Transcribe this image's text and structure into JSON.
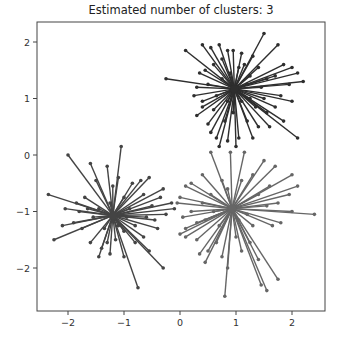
{
  "chart_data": {
    "type": "scatter",
    "title": "Estimated number of clusters:  3",
    "xlabel": "",
    "ylabel": "",
    "xlim": [
      -2.55,
      2.6
    ],
    "ylim": [
      -2.75,
      2.35
    ],
    "x_ticks": [
      -2,
      -1,
      0,
      1,
      2
    ],
    "y_ticks": [
      2,
      1,
      0,
      -1,
      -2
    ],
    "x_tick_labels": [
      "−2",
      "−1",
      "0",
      "1",
      "2"
    ],
    "y_tick_labels": [
      "2",
      "1",
      "0",
      "−1",
      "−2"
    ],
    "grid": false,
    "legend": null,
    "series": [
      {
        "name": "cluster-0",
        "color": "#2e2e2e",
        "center": [
          0.97,
          1.17
        ],
        "points": [
          [
            1.5,
            2.15
          ],
          [
            1.75,
            1.95
          ],
          [
            0.1,
            1.85
          ],
          [
            0.4,
            1.95
          ],
          [
            0.55,
            1.9
          ],
          [
            0.7,
            1.95
          ],
          [
            0.85,
            1.85
          ],
          [
            0.95,
            1.85
          ],
          [
            1.85,
            1.6
          ],
          [
            2.1,
            1.45
          ],
          [
            2.0,
            1.55
          ],
          [
            2.2,
            1.3
          ],
          [
            1.95,
            1.25
          ],
          [
            1.8,
            1.05
          ],
          [
            2.0,
            0.95
          ],
          [
            -0.25,
            1.35
          ],
          [
            0.3,
            1.2
          ],
          [
            0.25,
            1.05
          ],
          [
            0.4,
            0.95
          ],
          [
            0.3,
            0.7
          ],
          [
            0.5,
            0.55
          ],
          [
            0.55,
            0.4
          ],
          [
            0.65,
            0.3
          ],
          [
            0.7,
            0.15
          ],
          [
            0.85,
            0.25
          ],
          [
            1.0,
            0.15
          ],
          [
            1.05,
            0.3
          ],
          [
            1.3,
            0.3
          ],
          [
            1.4,
            0.5
          ],
          [
            1.6,
            0.5
          ],
          [
            2.1,
            0.3
          ],
          [
            1.85,
            0.6
          ],
          [
            1.55,
            0.75
          ],
          [
            1.7,
            0.85
          ],
          [
            0.45,
            1.5
          ],
          [
            0.6,
            1.6
          ],
          [
            1.3,
            1.75
          ],
          [
            1.15,
            1.6
          ],
          [
            1.4,
            1.55
          ],
          [
            0.75,
            1.7
          ],
          [
            1.1,
            1.8
          ],
          [
            0.35,
            1.45
          ],
          [
            0.5,
            1.25
          ],
          [
            0.6,
            0.8
          ],
          [
            0.8,
            0.6
          ],
          [
            1.2,
            0.6
          ],
          [
            1.35,
            0.85
          ],
          [
            1.5,
            1.0
          ],
          [
            1.55,
            1.35
          ],
          [
            1.25,
            1.4
          ],
          [
            0.75,
            1.35
          ],
          [
            0.85,
            0.95
          ],
          [
            1.1,
            0.95
          ],
          [
            1.2,
            1.25
          ],
          [
            0.9,
            1.45
          ],
          [
            0.65,
            1.05
          ],
          [
            1.45,
            1.2
          ],
          [
            1.05,
            1.55
          ],
          [
            0.4,
            0.85
          ],
          [
            1.7,
            1.4
          ],
          [
            0.95,
            0.75
          ],
          [
            1.25,
            1.0
          ]
        ]
      },
      {
        "name": "cluster-1",
        "color": "#444444",
        "center": [
          -1.2,
          -1.07
        ],
        "points": [
          [
            -2.0,
            0.0
          ],
          [
            -1.05,
            0.15
          ],
          [
            -1.6,
            -0.15
          ],
          [
            -1.3,
            -0.2
          ],
          [
            -1.5,
            -0.45
          ],
          [
            -1.1,
            -0.4
          ],
          [
            -2.35,
            -0.7
          ],
          [
            -1.85,
            -0.85
          ],
          [
            -2.05,
            -0.95
          ],
          [
            -1.7,
            -0.75
          ],
          [
            -1.9,
            -1.2
          ],
          [
            -2.1,
            -1.25
          ],
          [
            -2.25,
            -1.5
          ],
          [
            -1.75,
            -1.3
          ],
          [
            -1.6,
            -1.55
          ],
          [
            -1.4,
            -1.65
          ],
          [
            -1.45,
            -1.8
          ],
          [
            -1.25,
            -1.75
          ],
          [
            -1.3,
            -1.55
          ],
          [
            -1.0,
            -1.8
          ],
          [
            -0.75,
            -2.35
          ],
          [
            -0.8,
            -1.55
          ],
          [
            -0.55,
            -1.7
          ],
          [
            -0.3,
            -2.0
          ],
          [
            -0.4,
            -1.3
          ],
          [
            -0.25,
            -1.05
          ],
          [
            -0.5,
            -0.9
          ],
          [
            -0.1,
            -0.95
          ],
          [
            -0.15,
            -0.85
          ],
          [
            -0.3,
            -0.6
          ],
          [
            -0.55,
            -0.4
          ],
          [
            -0.65,
            -0.7
          ],
          [
            -0.7,
            -0.45
          ],
          [
            -0.85,
            -0.5
          ],
          [
            -1.0,
            -0.75
          ],
          [
            -1.2,
            -0.55
          ],
          [
            -1.45,
            -0.95
          ],
          [
            -1.55,
            -1.1
          ],
          [
            -1.0,
            -1.35
          ],
          [
            -0.8,
            -1.25
          ],
          [
            -0.6,
            -1.1
          ],
          [
            -0.9,
            -0.95
          ],
          [
            -1.35,
            -1.3
          ],
          [
            -1.15,
            -1.5
          ],
          [
            -0.65,
            -1.45
          ],
          [
            -1.8,
            -1.0
          ],
          [
            -1.25,
            -0.85
          ],
          [
            -0.45,
            -1.15
          ],
          [
            -0.95,
            -1.1
          ],
          [
            -1.65,
            -0.95
          ],
          [
            -1.1,
            -1.25
          ],
          [
            -0.35,
            -0.75
          ]
        ]
      },
      {
        "name": "cluster-2",
        "color": "#666666",
        "center": [
          0.93,
          -0.95
        ],
        "points": [
          [
            0.55,
            0.05
          ],
          [
            0.9,
            0.05
          ],
          [
            1.15,
            0.05
          ],
          [
            1.5,
            -0.1
          ],
          [
            1.7,
            -0.2
          ],
          [
            0.4,
            -0.35
          ],
          [
            0.2,
            -0.5
          ],
          [
            0.1,
            -0.55
          ],
          [
            0.0,
            -0.75
          ],
          [
            -0.05,
            -0.85
          ],
          [
            0.2,
            -1.0
          ],
          [
            0.05,
            -1.1
          ],
          [
            0.1,
            -1.3
          ],
          [
            0.0,
            -1.4
          ],
          [
            0.1,
            -1.45
          ],
          [
            0.3,
            -1.5
          ],
          [
            0.35,
            -1.75
          ],
          [
            0.45,
            -1.9
          ],
          [
            0.5,
            -1.7
          ],
          [
            0.75,
            -1.8
          ],
          [
            0.8,
            -2.5
          ],
          [
            0.85,
            -2.0
          ],
          [
            0.65,
            -1.55
          ],
          [
            1.0,
            -1.45
          ],
          [
            1.1,
            -1.7
          ],
          [
            1.4,
            -1.85
          ],
          [
            1.45,
            -2.3
          ],
          [
            1.55,
            -2.4
          ],
          [
            1.75,
            -2.2
          ],
          [
            1.25,
            -1.55
          ],
          [
            1.3,
            -1.25
          ],
          [
            1.65,
            -1.25
          ],
          [
            1.8,
            -1.2
          ],
          [
            2.0,
            -1.0
          ],
          [
            2.4,
            -1.05
          ],
          [
            1.55,
            -0.9
          ],
          [
            1.75,
            -0.85
          ],
          [
            1.95,
            -0.7
          ],
          [
            2.1,
            -0.55
          ],
          [
            2.0,
            -0.35
          ],
          [
            1.3,
            -0.35
          ],
          [
            1.1,
            -0.45
          ],
          [
            0.75,
            -0.45
          ],
          [
            0.55,
            -0.7
          ],
          [
            0.4,
            -0.85
          ],
          [
            0.45,
            -1.15
          ],
          [
            0.7,
            -1.25
          ],
          [
            1.2,
            -1.05
          ],
          [
            1.4,
            -0.7
          ],
          [
            0.85,
            -0.6
          ],
          [
            0.3,
            -1.2
          ],
          [
            1.05,
            -1.15
          ],
          [
            0.6,
            -1.0
          ],
          [
            1.6,
            -0.55
          ]
        ]
      }
    ]
  }
}
